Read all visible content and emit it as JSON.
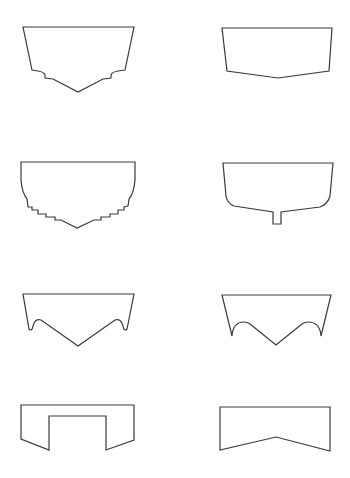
{
  "figure": {
    "stroke_color": "#3a3a3a",
    "background": "#ffffff",
    "profiles": [
      {
        "name": "stepped-chine-v-hull",
        "d": "M23,27 L134,27 L125,70 L118,71 Q112,72 111,75 L111,78 L103,79 L78,92 L53,79 L45,78 L45,75 Q44,72 38,71 L32,70 Z"
      },
      {
        "name": "shallow-v-hull",
        "d": "M222,28 L332,28 L329,71 L278,78 L227,71 Z"
      },
      {
        "name": "round-bilge-stepped-hull",
        "d": "M21,162 L135,162 L135,180 Q134,193 129,199 L128,206 L124,207 L124,210 L118,210 L118,214 L110,214 L110,217 L101,217 L101,220 L94,220 L77,228 L61,220 L55,220 L55,217 L46,217 L46,214 L38,214 L38,210 L32,210 L32,207 L28,207 L27,199 Q22,193 21,180 Z"
      },
      {
        "name": "round-bilge-keel-hull",
        "d": "M223,163 L333,163 L330,196 Q328,204 320,207 L281,212 L281,224 L273,224 L273,212 L234,206 Q227,203 226,196 Z"
      },
      {
        "name": "tunnel-v-hull",
        "d": "M23,294 L134,294 L127,329 Q124,332 123,326 Q121,318 115,320 L78,346 L41,320 Q35,318 33,326 Q32,332 29,329 Z"
      },
      {
        "name": "double-tunnel-v-hull",
        "d": "M222,295 L331,295 L321,336 Q320,322 308,322 Q305,322 302,324 L276,345 L250,324 Q247,322 244,322 Q233,322 232,336 Z"
      },
      {
        "name": "catamaran-tunnel-hull",
        "d": "M21,405 L134,405 L134,440 L106,450 L106,416 L49,416 L49,450 L21,439 Z"
      },
      {
        "name": "inverted-v-hull",
        "d": "M220,407 L330,407 L330,451 L276,437 L220,450 Z"
      }
    ]
  }
}
